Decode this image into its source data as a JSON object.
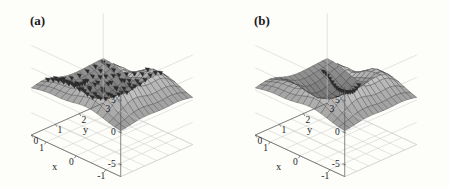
{
  "figure": {
    "background_color": "#fdfdfa",
    "panels": [
      {
        "id": "panel-a",
        "label": "(a)",
        "arrow_mode": "full-field",
        "arrow_count": 96,
        "description": "Surface plot with dense field of descent arrows across the right slope"
      },
      {
        "id": "panel-b",
        "label": "(b)",
        "arrow_mode": "single-trajectory",
        "arrow_count": 17,
        "description": "Surface plot with a single narrow chain of descent arrows down the central valley"
      }
    ]
  },
  "chart_data": {
    "type": "surface",
    "title": "",
    "subtitle": "",
    "panel_labels": [
      "(a)",
      "(b)"
    ],
    "xlabel": "x",
    "ylabel": "y",
    "zlabel": "",
    "xlim": [
      -1.5,
      1.5
    ],
    "ylim": [
      0,
      3
    ],
    "zlim": [
      -7,
      7
    ],
    "xticks": [
      1,
      0,
      -1
    ],
    "xticklabels": [
      "1",
      "0",
      "-1"
    ],
    "yticks": [
      0,
      1,
      2,
      3
    ],
    "yticklabels": [
      "0",
      "1",
      "2",
      "3"
    ],
    "zticks": [
      5,
      0,
      -5
    ],
    "zticklabels": [
      "5",
      "0",
      "-5"
    ],
    "grid": true,
    "legend": null,
    "colormap": "grayscale",
    "surface_color_light": "#e2e2e2",
    "surface_color_dark": "#4a4a4a",
    "mesh_color": "#3a3a3a",
    "arrow_color": "#2b2b2b",
    "view": {
      "azimuth": -52,
      "elevation": 24
    },
    "grid_nx": 15,
    "grid_ny": 15,
    "surface_function": "peaks-like: two positive lobes with a central saddle valley",
    "features": [
      {
        "name": "primary-peak",
        "x": -0.35,
        "y": 1.1,
        "z": 6.2
      },
      {
        "name": "secondary-peak",
        "x": -0.45,
        "y": 2.4,
        "z": 3.4
      },
      {
        "name": "central-valley",
        "x": 0.15,
        "y": 1.7,
        "z": -4.5
      }
    ]
  }
}
